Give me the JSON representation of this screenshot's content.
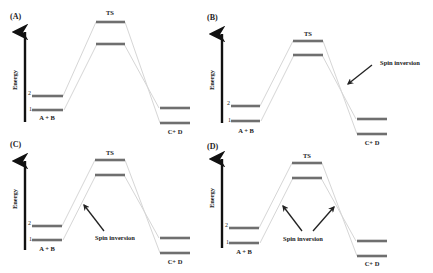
{
  "colors": {
    "bar": "#6f6f6f",
    "connector": "#d6d6d6",
    "axis": "#111111",
    "text": "#222222",
    "arrow": "#222222"
  },
  "labels": {
    "energy": "Energy",
    "reactants": "A + B",
    "products": "C+ D",
    "ts": "TS",
    "level_2": "2",
    "level_1": "1",
    "spin_inversion": "Spin inversion"
  },
  "panels": [
    {
      "id": "A",
      "tag": "(A)",
      "tagPos": [
        10,
        19
      ],
      "axis": {
        "x": 25,
        "y1": 122,
        "y2": 28,
        "labelX": 17,
        "labelY": 80
      },
      "reactants": {
        "x1": 32,
        "x2": 63,
        "y2": 96,
        "y1": 110,
        "labelX": 47,
        "labelY": 120
      },
      "ts": {
        "x1": 96,
        "x2": 125,
        "yTop": 22,
        "yBot": 44,
        "labelX": 110,
        "labelY": 15
      },
      "products": {
        "x1": 160,
        "x2": 190,
        "yTop": 108,
        "yBot": 123,
        "labelX": 175,
        "labelY": 134
      },
      "spin": null
    },
    {
      "id": "B",
      "tag": "(B)",
      "tagPos": [
        207,
        20
      ],
      "axis": {
        "x": 222,
        "y1": 123,
        "y2": 30,
        "labelX": 214,
        "labelY": 80
      },
      "reactants": {
        "x1": 231,
        "x2": 260,
        "y2": 106,
        "y1": 121,
        "labelX": 246,
        "labelY": 133
      },
      "ts": {
        "x1": 293,
        "x2": 323,
        "yTop": 41,
        "yBot": 55,
        "labelX": 308,
        "labelY": 36
      },
      "products": {
        "x1": 357,
        "x2": 387,
        "yTop": 119,
        "yBot": 134,
        "labelX": 372,
        "labelY": 145
      },
      "spin": {
        "textX": 400,
        "textY": 65,
        "arrows": [
          [
            372,
            65,
            348,
            84
          ]
        ]
      }
    },
    {
      "id": "C",
      "tag": "(C)",
      "tagPos": [
        10,
        147
      ],
      "axis": {
        "x": 25,
        "y1": 250,
        "y2": 157,
        "labelX": 17,
        "labelY": 199
      },
      "reactants": {
        "x1": 32,
        "x2": 62,
        "y2": 226,
        "y1": 240,
        "labelX": 47,
        "labelY": 251
      },
      "ts": {
        "x1": 95,
        "x2": 125,
        "yTop": 160,
        "yBot": 175,
        "labelX": 110,
        "labelY": 155
      },
      "products": {
        "x1": 160,
        "x2": 190,
        "yTop": 238,
        "yBot": 253,
        "labelX": 175,
        "labelY": 264
      },
      "spin": {
        "textX": 115,
        "textY": 240,
        "arrows": [
          [
            104,
            231,
            84,
            205
          ]
        ]
      }
    },
    {
      "id": "D",
      "tag": "(D)",
      "tagPos": [
        207,
        149
      ],
      "axis": {
        "x": 222,
        "y1": 248,
        "y2": 155,
        "labelX": 214,
        "labelY": 198
      },
      "reactants": {
        "x1": 229,
        "x2": 259,
        "y2": 228,
        "y1": 243,
        "labelX": 244,
        "labelY": 254
      },
      "ts": {
        "x1": 292,
        "x2": 322,
        "yTop": 163,
        "yBot": 178,
        "labelX": 307,
        "labelY": 158
      },
      "products": {
        "x1": 357,
        "x2": 387,
        "yTop": 241,
        "yBot": 256,
        "labelX": 372,
        "labelY": 266
      },
      "spin": {
        "textX": 303,
        "textY": 241,
        "arrows": [
          [
            302,
            231,
            283,
            206
          ],
          [
            313,
            231,
            334,
            207
          ]
        ]
      }
    }
  ]
}
